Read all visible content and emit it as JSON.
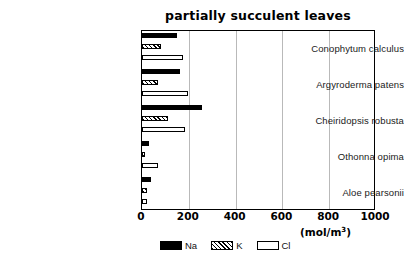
{
  "chart_data": {
    "type": "bar",
    "orientation": "horizontal",
    "title": "partially succulent leaves",
    "xlabel": "(mol/m3)",
    "ylabel": "",
    "xlim": [
      0,
      1000
    ],
    "xticks": [
      0,
      200,
      400,
      600,
      800,
      1000
    ],
    "xtick_labels": [
      "0",
      "200",
      "400",
      "600",
      "800",
      "1000"
    ],
    "grid": true,
    "grid_axis": "x",
    "legend_position": "bottom",
    "categories": [
      "Conophytum calculus",
      "Argyroderma patens",
      "Cheiridopsis robusta",
      "Othonna opima",
      "Aloe pearsonii"
    ],
    "series": [
      {
        "name": "Na",
        "values": [
          150,
          162,
          256,
          30,
          40
        ]
      },
      {
        "name": "K",
        "values": [
          80,
          68,
          110,
          13,
          20
        ]
      },
      {
        "name": "Cl",
        "values": [
          175,
          195,
          183,
          68,
          22
        ]
      }
    ]
  },
  "axis": {
    "unit_prefix": "(mol/m",
    "unit_exponent": "3",
    "unit_suffix": ")"
  },
  "legend": {
    "entries": [
      {
        "label": "Na",
        "style": "solid-black"
      },
      {
        "label": "K",
        "style": "hatched"
      },
      {
        "label": "Cl",
        "style": "open-white"
      }
    ]
  }
}
